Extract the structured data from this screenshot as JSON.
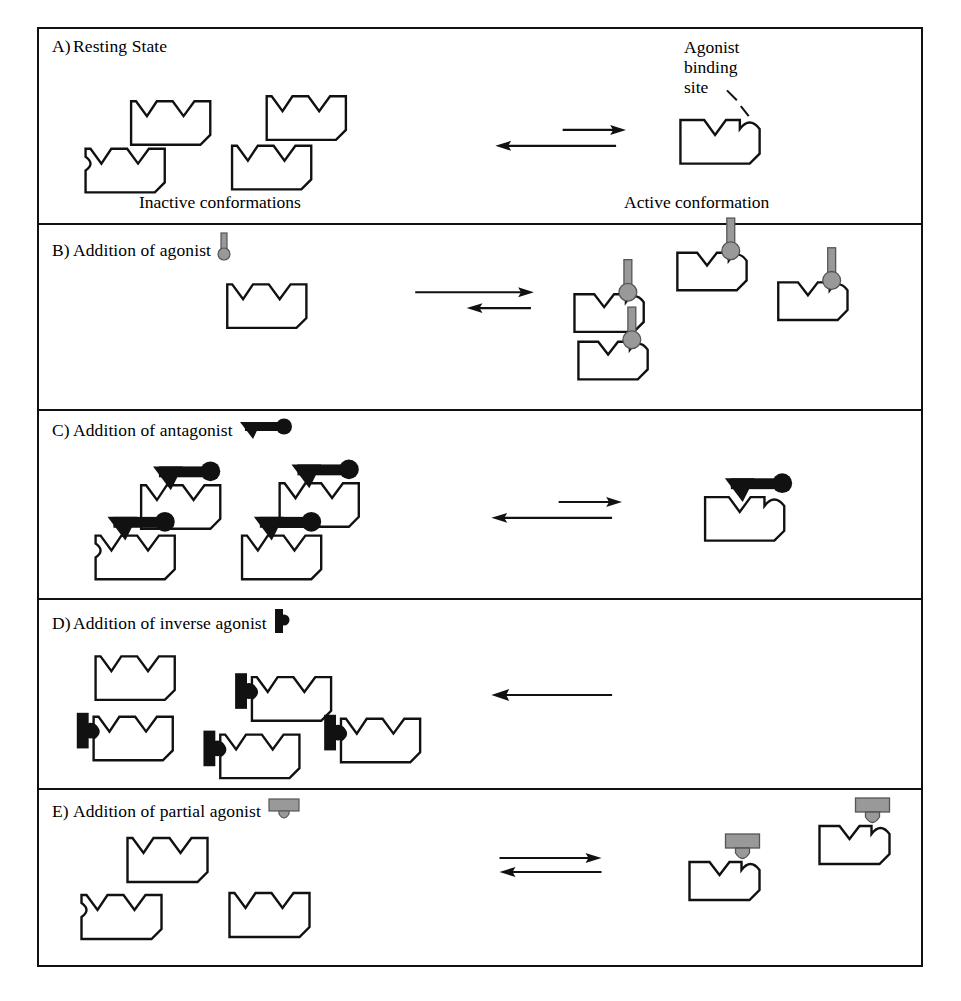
{
  "figure": {
    "title_semantic": "receptor-conformational-states-and-ligand-classes",
    "border_color": "#111111",
    "background": "#ffffff"
  },
  "colors": {
    "outline": "#111111",
    "ligand_gray": "#999999",
    "ligand_gray_edge": "#555555",
    "ligand_black": "#111111"
  },
  "panels": [
    {
      "id": "A",
      "lead": "A)",
      "title": "Resting State",
      "title_icon": "none",
      "left_caption": "Inactive conformations",
      "right_caption": "Active conformation",
      "callout": "Agonist\nbinding\nsite",
      "equilibrium": {
        "type": "double-arrow",
        "forward_label": "to-active",
        "reverse_label": "to-inactive",
        "bias": "reverse",
        "forward_len_px": 62,
        "reverse_len_px": 112
      },
      "left_receptors": 4,
      "right_receptors": 1,
      "left_ligand": "none",
      "right_ligand": "none"
    },
    {
      "id": "B",
      "lead": "B)",
      "title": "Addition of agonist",
      "title_icon": "agonist-icon",
      "left_caption": "",
      "right_caption": "",
      "callout": "",
      "equilibrium": {
        "type": "double-arrow",
        "forward_label": "to-active",
        "reverse_label": "to-inactive",
        "bias": "forward",
        "forward_len_px": 118,
        "reverse_len_px": 58
      },
      "left_receptors": 1,
      "right_receptors": 4,
      "left_ligand": "none",
      "right_ligand": "agonist-icon"
    },
    {
      "id": "C",
      "lead": "C)",
      "title": "Addition of antagonist",
      "title_icon": "antagonist-icon",
      "left_caption": "",
      "right_caption": "",
      "callout": "",
      "equilibrium": {
        "type": "double-arrow",
        "forward_label": "to-active",
        "reverse_label": "to-inactive",
        "bias": "reverse",
        "forward_len_px": 62,
        "reverse_len_px": 112
      },
      "left_receptors": 4,
      "right_receptors": 1,
      "left_ligand": "antagonist-icon",
      "right_ligand": "antagonist-icon"
    },
    {
      "id": "D",
      "lead": "D)",
      "title": "Addition of inverse agonist",
      "title_icon": "inverse-agonist-icon",
      "left_caption": "",
      "right_caption": "",
      "callout": "",
      "equilibrium": {
        "type": "single-arrow",
        "forward_label": "",
        "reverse_label": "to-inactive",
        "bias": "reverse-only",
        "forward_len_px": 0,
        "reverse_len_px": 110
      },
      "left_receptors": 5,
      "right_receptors": 0,
      "left_ligand": "inverse-agonist-icon",
      "right_ligand": "none"
    },
    {
      "id": "E",
      "lead": "E)",
      "title": "Addition of partial agonist",
      "title_icon": "partial-agonist-icon",
      "left_caption": "",
      "right_caption": "",
      "callout": "",
      "equilibrium": {
        "type": "double-arrow",
        "forward_label": "to-active",
        "reverse_label": "to-inactive",
        "bias": "balanced",
        "forward_len_px": 100,
        "reverse_len_px": 100
      },
      "left_receptors": 3,
      "right_receptors": 2,
      "left_ligand": "none",
      "right_ligand": "partial-agonist-icon"
    }
  ],
  "legend_icons": {
    "agonist": "gray pin: narrow stem with rounded ball at base",
    "antagonist": "black: down-pointing triangle, horizontal bar, round knob at right",
    "inverse_agonist": "black: vertical bar with small round bump on right",
    "partial_agonist": "gray: wide flat block with rounded tab below"
  }
}
